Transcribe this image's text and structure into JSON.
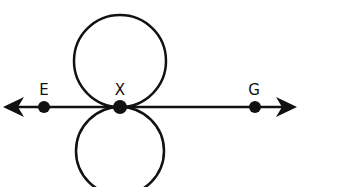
{
  "diagram": {
    "line": {
      "y": 107,
      "x_start": 3,
      "x_end": 297,
      "arrows": "both"
    },
    "points": [
      {
        "label": "E",
        "x": 44,
        "y": 107
      },
      {
        "label": "X",
        "x": 120,
        "y": 107
      },
      {
        "label": "G",
        "x": 255,
        "y": 107
      }
    ],
    "circles": [
      {
        "name": "upper",
        "cx": 120,
        "cy": 61,
        "r": 46,
        "tangent_at": "X"
      },
      {
        "name": "lower",
        "cx": 120,
        "cy": 151,
        "r": 44,
        "tangent_at": "X"
      }
    ],
    "colors": {
      "stroke": "#111111",
      "background": "#ffffff"
    }
  }
}
